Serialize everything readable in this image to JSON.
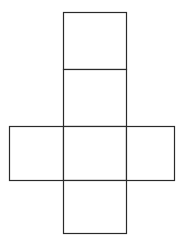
{
  "diagram": {
    "type": "cube-net",
    "stroke_color": "#2a2a2a",
    "background": "#ffffff",
    "faces": [
      {
        "id": "top-1",
        "x": 63,
        "y": 12,
        "w": 63,
        "h": 57
      },
      {
        "id": "top-2",
        "x": 63,
        "y": 69,
        "w": 63,
        "h": 57
      },
      {
        "id": "left",
        "x": 9,
        "y": 126,
        "w": 54,
        "h": 54
      },
      {
        "id": "center",
        "x": 63,
        "y": 126,
        "w": 63,
        "h": 54
      },
      {
        "id": "right",
        "x": 126,
        "y": 126,
        "w": 48,
        "h": 54
      },
      {
        "id": "bottom",
        "x": 63,
        "y": 180,
        "w": 63,
        "h": 53
      }
    ]
  }
}
